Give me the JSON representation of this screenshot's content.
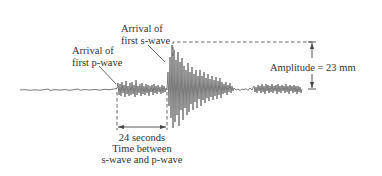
{
  "diagram": {
    "type": "seismogram",
    "labels": {
      "p_wave_line1": "Arrival of",
      "p_wave_line2": "first p-wave",
      "s_wave_line1": "Arrival of",
      "s_wave_line2": "first s-wave",
      "amplitude": "Amplitude = 23 mm",
      "interval_value": "24 seconds",
      "interval_line1": "Time between",
      "interval_line2": "s-wave and p-wave"
    },
    "measurements": {
      "amplitude_mm": 23,
      "sp_interval_seconds": 24
    },
    "colors": {
      "trace": "#6b6b6b",
      "annotation": "#444444",
      "text": "#333333",
      "background": "#ffffff"
    }
  }
}
